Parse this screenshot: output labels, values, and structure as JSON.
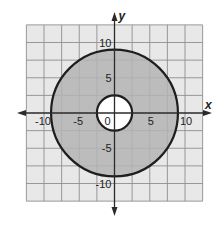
{
  "diagram": {
    "type": "coordinate-plane-annulus",
    "axes": {
      "x_label": "x",
      "y_label": "y"
    },
    "tick_labels": {
      "x": [
        {
          "value": -10,
          "label": "-10"
        },
        {
          "value": -5,
          "label": "-5"
        },
        {
          "value": 5,
          "label": "5"
        },
        {
          "value": 10,
          "label": "10"
        }
      ],
      "y": [
        {
          "value": 10,
          "label": "10"
        },
        {
          "value": 5,
          "label": "5"
        },
        {
          "value": -5,
          "label": "-5"
        },
        {
          "value": -10,
          "label": "-10"
        }
      ],
      "origin": "0"
    },
    "grid": {
      "min": -12.5,
      "max": 12.5,
      "step": 2.5
    },
    "shapes": [
      {
        "name": "outer-circle",
        "center": [
          0,
          0
        ],
        "radius": 9
      },
      {
        "name": "inner-circle",
        "center": [
          0,
          0
        ],
        "radius": 2.5
      }
    ],
    "shaded_region": "between outer and inner circle",
    "colors": {
      "grid_background": "#e8e8e8",
      "grid_line": "#8e8e8e",
      "shaded": "#b4b4b4",
      "hole": "#ffffff",
      "stroke": "#1e1e1e",
      "axis": "#2a2a2a"
    }
  }
}
